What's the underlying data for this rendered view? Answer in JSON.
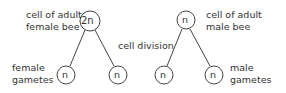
{
  "female": {
    "parent_label_line1": "cell of adult",
    "parent_label_line2": "female bee",
    "parent_ploidy": "2n",
    "gamete_label_line1": "female",
    "gamete_label_line2": "gametes",
    "gamete_ploidy_left": "n",
    "gamete_ploidy_right": "n"
  },
  "process_label": "cell division",
  "male": {
    "parent_label_line1": "cell of adult",
    "parent_label_line2": "male bee",
    "parent_ploidy": "n",
    "gamete_label_line1": "male",
    "gamete_label_line2": "gametes",
    "gamete_ploidy_left": "n",
    "gamete_ploidy_right": "n"
  }
}
